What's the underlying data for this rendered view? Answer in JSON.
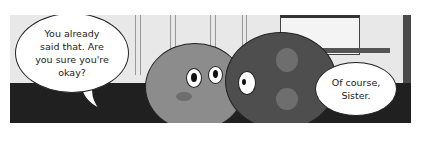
{
  "comic_panel": {
    "bubbles": [
      {
        "speaker": "left-character",
        "text": "You already\nsaid that. Are\nyou sure you're\nokay?"
      },
      {
        "speaker": "right-character",
        "text": "Of course,\nSister."
      }
    ],
    "characters": [
      {
        "name": "sister",
        "color": "#8c8c8c"
      },
      {
        "name": "brother",
        "color": "#4e4e4e"
      }
    ],
    "colors": {
      "wall": "#e8e8e8",
      "floor": "#202020",
      "bubble": "#ffffff",
      "outline": "#222222"
    }
  }
}
